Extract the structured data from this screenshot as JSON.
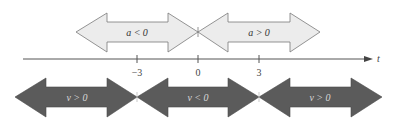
{
  "axis": {
    "variable": "t",
    "ticks": [
      {
        "value": -3,
        "label": "−3"
      },
      {
        "value": 0,
        "label": "0"
      },
      {
        "value": 3,
        "label": "3"
      }
    ]
  },
  "top_arrows": [
    {
      "from": "-inf",
      "to": 0,
      "label_var": "a",
      "label_op": "<",
      "label_val": "0",
      "label": "a < 0",
      "style": "light"
    },
    {
      "from": 0,
      "to": "inf",
      "label_var": "a",
      "label_op": ">",
      "label_val": "0",
      "label": "a > 0",
      "style": "light"
    }
  ],
  "bottom_arrows": [
    {
      "from": "-inf",
      "to": -3,
      "label_var": "v",
      "label_op": ">",
      "label_val": "0",
      "label": "v > 0",
      "style": "dark"
    },
    {
      "from": -3,
      "to": 3,
      "label_var": "v",
      "label_op": "<",
      "label_val": "0",
      "label": "v < 0",
      "style": "dark"
    },
    {
      "from": 3,
      "to": "inf",
      "label_var": "v",
      "label_op": ">",
      "label_val": "0",
      "label": "v > 0",
      "style": "dark"
    }
  ],
  "colors": {
    "light_fill": "#ececec",
    "dark_fill": "#5b5b5b",
    "dark_text": "#d8d8d8",
    "light_text": "#333333"
  }
}
